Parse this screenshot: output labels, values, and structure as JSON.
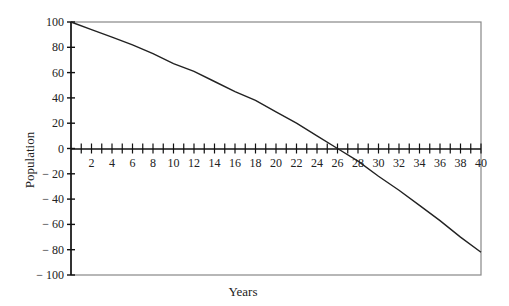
{
  "chart_data": {
    "type": "line",
    "title": "",
    "xlabel": "Years",
    "ylabel": "Population",
    "xlim": [
      0,
      40
    ],
    "ylim": [
      -100,
      100
    ],
    "grid": false,
    "legend": null,
    "x_ticks": [
      2,
      4,
      6,
      8,
      10,
      12,
      14,
      16,
      18,
      20,
      22,
      24,
      26,
      28,
      30,
      32,
      34,
      36,
      38,
      40
    ],
    "x_minor_ticks_every": 1,
    "y_ticks": [
      100,
      80,
      60,
      40,
      20,
      0,
      -20,
      -40,
      -60,
      -80,
      -100
    ],
    "y_tick_labels": [
      "100",
      "80",
      "60",
      "40",
      "20",
      "0",
      "− 20",
      "− 40",
      "− 60",
      "− 80",
      "− 100"
    ],
    "series": [
      {
        "name": "Population",
        "x": [
          0,
          2,
          4,
          6,
          8,
          10,
          12,
          14,
          16,
          18,
          20,
          22,
          24,
          26,
          28,
          30,
          32,
          34,
          36,
          38,
          40
        ],
        "values": [
          100,
          94,
          88,
          82,
          75,
          67,
          61,
          53,
          45,
          38,
          29,
          20,
          10,
          0,
          -10,
          -22,
          -33,
          -45,
          -57,
          -70,
          -82
        ]
      }
    ]
  }
}
